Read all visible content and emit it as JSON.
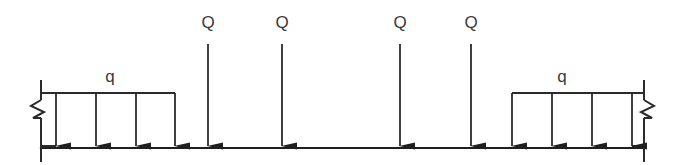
{
  "diagram": {
    "type": "structural-beam-loading",
    "colors": {
      "line": "#2b2b2b",
      "beam": "#1f1f1f",
      "text": "#3a3a3a",
      "background": "#ffffff"
    },
    "beam": {
      "label": "beam-axis",
      "x_start": 41,
      "x_end": 644,
      "y": 148,
      "stroke_width": 2
    },
    "supports": [
      {
        "name": "left-break-symbol",
        "side": "left",
        "x": 41,
        "y_top": 80,
        "y_bottom": 162,
        "break_y": 108
      },
      {
        "name": "right-break-symbol",
        "side": "right",
        "x": 644,
        "y_top": 80,
        "y_bottom": 162,
        "break_y": 108
      }
    ],
    "distributed_loads": [
      {
        "name": "left-distributed-load",
        "label": "q",
        "label_x": 110,
        "label_y": 68,
        "x_start": 56,
        "x_end": 175,
        "bar_y": 93,
        "arrow_tip_y": 146,
        "arrow_x": [
          56,
          96,
          136,
          175
        ]
      },
      {
        "name": "right-distributed-load",
        "label": "q",
        "label_x": 562,
        "label_y": 68,
        "x_start": 512,
        "x_end": 632,
        "bar_y": 93,
        "arrow_tip_y": 146,
        "arrow_x": [
          512,
          552,
          592,
          632
        ]
      }
    ],
    "point_loads": [
      {
        "name": "point-load-1",
        "label": "Q",
        "x": 208,
        "label_y": 14,
        "line_top_y": 44,
        "arrow_tip_y": 146
      },
      {
        "name": "point-load-2",
        "label": "Q",
        "x": 282,
        "label_y": 14,
        "line_top_y": 44,
        "arrow_tip_y": 146
      },
      {
        "name": "point-load-3",
        "label": "Q",
        "x": 400,
        "label_y": 14,
        "line_top_y": 44,
        "arrow_tip_y": 146
      },
      {
        "name": "point-load-4",
        "label": "Q",
        "x": 471,
        "label_y": 14,
        "line_top_y": 44,
        "arrow_tip_y": 146
      }
    ],
    "labels": {
      "uniform_load_symbol": "q",
      "point_load_symbol": "Q"
    }
  }
}
